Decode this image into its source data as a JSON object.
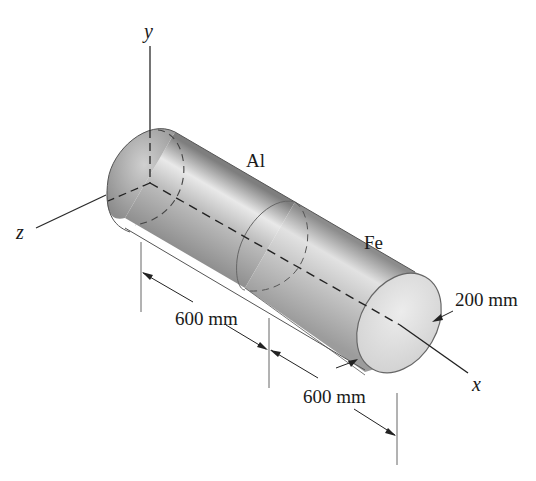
{
  "figure": {
    "type": "composite shaft diagram",
    "axes": {
      "x_label": "x",
      "y_label": "y",
      "z_label": "z"
    },
    "segments": [
      {
        "material_label": "Al",
        "length_label": "600 mm"
      },
      {
        "material_label": "Fe",
        "length_label": "600 mm"
      }
    ],
    "diameter_label": "200 mm",
    "colors": {
      "line": "#2a2a2a",
      "cylinder_dark": "#8a8a8a",
      "cylinder_light": "#e8e8e8",
      "end_face": "#d6d6d6"
    }
  }
}
